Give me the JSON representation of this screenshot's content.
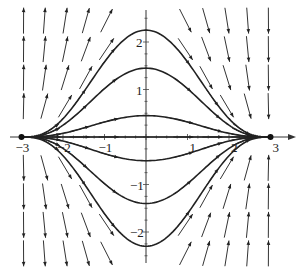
{
  "chart_data": {
    "type": "line",
    "title": "",
    "subtitle": "",
    "xlabel": "",
    "ylabel": "",
    "xlim": [
      -3.2,
      3.3
    ],
    "ylim": [
      -2.6,
      2.7
    ],
    "grid": false,
    "legend": "none",
    "x_ticks": [
      -3,
      -2,
      -1,
      1,
      2,
      3
    ],
    "x_tick_labels": [
      "−3",
      "−2",
      "−1",
      "1",
      "2",
      "3"
    ],
    "y_ticks": [
      2,
      1,
      -1,
      -2
    ],
    "y_tick_labels": [
      "2",
      "1",
      "−1",
      "−2"
    ],
    "field_slope_rule": "dy/dx = -6xy/(9 - x^2)",
    "series": [
      {
        "name": "solution-peak-2.25",
        "peak": 2.25,
        "x_range": [
          -3,
          3
        ]
      },
      {
        "name": "solution-peak-1.45",
        "peak": 1.45,
        "x_range": [
          -3,
          3
        ]
      },
      {
        "name": "solution-peak-0.45",
        "peak": 0.45,
        "x_range": [
          -3,
          3
        ]
      },
      {
        "name": "solution-peak-0",
        "peak": 0.0,
        "x_range": [
          -3,
          3
        ]
      },
      {
        "name": "solution-peak-neg-0.5",
        "peak": -0.5,
        "x_range": [
          -3,
          3
        ]
      },
      {
        "name": "solution-peak-neg-1.4",
        "peak": -1.4,
        "x_range": [
          -3,
          3
        ]
      },
      {
        "name": "solution-peak-neg-2.3",
        "peak": -2.3,
        "x_range": [
          -3,
          3
        ]
      }
    ],
    "equilibrium_points": [
      {
        "x": -3,
        "y": 0,
        "type": "source"
      },
      {
        "x": 3,
        "y": 0,
        "type": "sink"
      }
    ]
  }
}
